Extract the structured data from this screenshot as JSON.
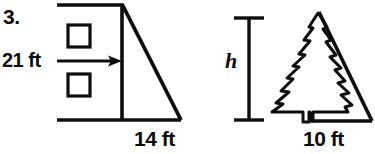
{
  "document": {
    "type": "math-worksheet-figure",
    "problem_number": "3.",
    "ink_color": "#0d0d0d",
    "background_color": "#ffffff"
  },
  "left_figure": {
    "name": "right-triangle-with-height-marker",
    "height_label": "21 ft",
    "base_label": "14 ft",
    "arrow_icon": "right-arrow-icon",
    "square_markers": 2,
    "description": "right triangle with vertical left leg and horizontal base"
  },
  "right_figure": {
    "name": "pine-tree-with-right-triangle",
    "height_label": "h",
    "base_label": "10 ft",
    "dimension_bar_icon": "vertical-dimension-bar-icon",
    "tree_icon": "pine-tree-icon",
    "description": "pine tree inscribed in a right triangle"
  }
}
